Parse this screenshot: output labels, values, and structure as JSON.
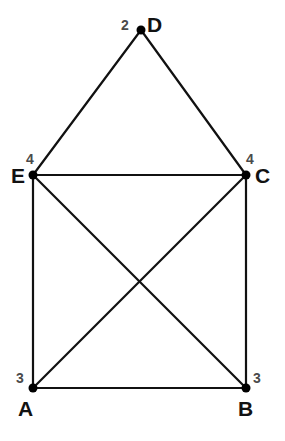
{
  "figure": {
    "background_color": "#ffffff",
    "edge_color": "#111111",
    "vertex_color": "#000000",
    "label_color": "#121212",
    "degree_color": "#4a4a4a"
  },
  "chart_data": {
    "type": "diagram",
    "subtype": "node-link-graph",
    "title": "",
    "directed": false,
    "nodes": [
      {
        "id": "A",
        "label": "A",
        "degree": "3",
        "x": 33,
        "y": 388,
        "label_x": 18,
        "label_y": 398,
        "degree_x": 16,
        "degree_y": 371
      },
      {
        "id": "B",
        "label": "B",
        "degree": "3",
        "x": 246,
        "y": 388,
        "label_x": 238,
        "label_y": 398,
        "degree_x": 253,
        "degree_y": 371
      },
      {
        "id": "C",
        "label": "C",
        "degree": "4",
        "x": 246,
        "y": 175,
        "label_x": 255,
        "label_y": 165,
        "degree_x": 246,
        "degree_y": 152
      },
      {
        "id": "D",
        "label": "D",
        "degree": "2",
        "x": 141,
        "y": 30,
        "label_x": 147,
        "label_y": 14,
        "degree_x": 121,
        "degree_y": 18
      },
      {
        "id": "E",
        "label": "E",
        "degree": "4",
        "x": 33,
        "y": 175,
        "label_x": 11,
        "label_y": 165,
        "degree_x": 26,
        "degree_y": 152
      }
    ],
    "edges": [
      {
        "from": "D",
        "to": "E"
      },
      {
        "from": "D",
        "to": "C"
      },
      {
        "from": "E",
        "to": "C"
      },
      {
        "from": "E",
        "to": "A"
      },
      {
        "from": "C",
        "to": "B"
      },
      {
        "from": "A",
        "to": "B"
      },
      {
        "from": "E",
        "to": "B"
      },
      {
        "from": "C",
        "to": "A"
      }
    ],
    "node_radius": 4.5,
    "edge_width": 2.2
  }
}
